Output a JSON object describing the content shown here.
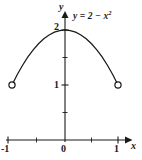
{
  "figure": {
    "title": "",
    "background_color": "#ffffff",
    "ink_color": "#1a1a1a",
    "width": 142,
    "height": 160
  },
  "labels": {
    "y_axis_name": "y",
    "x_axis_name": "x",
    "equation": "y = 2 − x",
    "equation_exponent": "2",
    "y_tick_2": "2",
    "y_tick_1": "1",
    "x_tick_0": "0",
    "x_tick_1": "1",
    "x_tick_neg1": "-1"
  },
  "chart_data": {
    "type": "line",
    "title": "",
    "subtitle": "",
    "xlabel": "x",
    "ylabel": "y",
    "equation": "y = 2 - x^2",
    "domain": [
      -1,
      1
    ],
    "endpoints_included": false,
    "endpoint_marker": "open-circle",
    "xlim": [
      -1.2,
      1.25
    ],
    "ylim": [
      -0.08,
      2.35
    ],
    "grid": false,
    "legend": null,
    "annotations": [
      {
        "text": "y = 2 - x^2",
        "x": 0.45,
        "y": 2.1
      }
    ],
    "axes": {
      "x": {
        "major_ticks": [
          -1,
          0,
          1
        ],
        "major_tick_labels": [
          "-1",
          "0",
          "1"
        ],
        "minor_ticks": [
          -0.5,
          0.5
        ],
        "arrow": "right"
      },
      "y": {
        "major_ticks": [
          1,
          2
        ],
        "major_tick_labels": [
          "1",
          "2"
        ],
        "minor_ticks": [
          0.5,
          1.5
        ],
        "arrow": "up"
      }
    },
    "series": [
      {
        "name": "y = 2 - x^2",
        "x": [
          -1.0,
          -0.9,
          -0.8,
          -0.7,
          -0.6,
          -0.5,
          -0.4,
          -0.3,
          -0.2,
          -0.1,
          0.0,
          0.1,
          0.2,
          0.3,
          0.4,
          0.5,
          0.6,
          0.7,
          0.8,
          0.9,
          1.0
        ],
        "values": [
          1.0,
          1.19,
          1.36,
          1.51,
          1.64,
          1.75,
          1.84,
          1.91,
          1.96,
          1.99,
          2.0,
          1.99,
          1.96,
          1.91,
          1.84,
          1.75,
          1.64,
          1.51,
          1.36,
          1.19,
          1.0
        ]
      }
    ],
    "markers": [
      {
        "x": -1,
        "y": 1,
        "style": "open-circle"
      },
      {
        "x": 1,
        "y": 1,
        "style": "open-circle"
      }
    ],
    "vertex": {
      "x": 0,
      "y": 2
    }
  }
}
